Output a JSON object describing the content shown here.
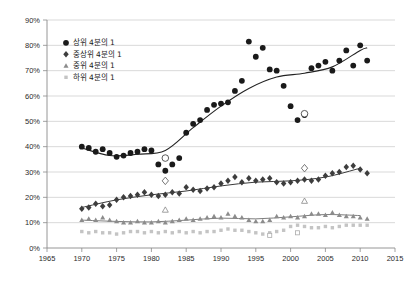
{
  "chart_data": {
    "type": "scatter",
    "title": "",
    "subtitle": "",
    "xlabel": "",
    "ylabel": "",
    "xlim": [
      1965,
      2015
    ],
    "ylim": [
      0,
      90
    ],
    "grid": true,
    "legend_position": "top-left",
    "x_ticks": [
      "1965",
      "1970",
      "1975",
      "1980",
      "1985",
      "1990",
      "1995",
      "2000",
      "2005",
      "2010",
      "2015"
    ],
    "y_ticks": [
      "0%",
      "10%",
      "20%",
      "30%",
      "40%",
      "50%",
      "60%",
      "70%",
      "80%",
      "90%"
    ],
    "series": [
      {
        "name": "상위 4분의 1",
        "marker": "circle-filled",
        "color": "#1a1a1a",
        "has_trendline": true,
        "points": [
          {
            "x": 1970,
            "y": 40.0
          },
          {
            "x": 1971,
            "y": 39.5
          },
          {
            "x": 1972,
            "y": 38.0
          },
          {
            "x": 1973,
            "y": 39.0
          },
          {
            "x": 1974,
            "y": 37.5
          },
          {
            "x": 1975,
            "y": 36.0
          },
          {
            "x": 1976,
            "y": 36.5
          },
          {
            "x": 1977,
            "y": 37.5
          },
          {
            "x": 1978,
            "y": 38.0
          },
          {
            "x": 1979,
            "y": 39.0
          },
          {
            "x": 1980,
            "y": 38.5
          },
          {
            "x": 1981,
            "y": 33.0
          },
          {
            "x": 1982,
            "y": 30.5
          },
          {
            "x": 1983,
            "y": 33.0
          },
          {
            "x": 1984,
            "y": 35.5
          },
          {
            "x": 1985,
            "y": 45.5
          },
          {
            "x": 1986,
            "y": 49.0
          },
          {
            "x": 1987,
            "y": 50.5
          },
          {
            "x": 1988,
            "y": 54.5
          },
          {
            "x": 1989,
            "y": 56.5
          },
          {
            "x": 1990,
            "y": 57.0
          },
          {
            "x": 1991,
            "y": 57.5
          },
          {
            "x": 1992,
            "y": 62.0
          },
          {
            "x": 1993,
            "y": 66.0
          },
          {
            "x": 1994,
            "y": 81.5
          },
          {
            "x": 1995,
            "y": 75.5
          },
          {
            "x": 1996,
            "y": 79.0
          },
          {
            "x": 1997,
            "y": 70.5
          },
          {
            "x": 1998,
            "y": 70.0
          },
          {
            "x": 1999,
            "y": 64.0
          },
          {
            "x": 2000,
            "y": 56.0
          },
          {
            "x": 2001,
            "y": 50.5
          },
          {
            "x": 2002,
            "y": 52.5
          },
          {
            "x": 2003,
            "y": 71.0
          },
          {
            "x": 2004,
            "y": 72.0
          },
          {
            "x": 2005,
            "y": 73.5
          },
          {
            "x": 2006,
            "y": 70.0
          },
          {
            "x": 2007,
            "y": 74.0
          },
          {
            "x": 2008,
            "y": 78.0
          },
          {
            "x": 2009,
            "y": 72.0
          },
          {
            "x": 2010,
            "y": 80.0
          },
          {
            "x": 2011,
            "y": 74.0
          }
        ],
        "open_points": [
          {
            "x": 1982,
            "y": 35.5
          },
          {
            "x": 2002,
            "y": 53.0
          }
        ],
        "trend": [
          {
            "x": 1970,
            "y": 39.5
          },
          {
            "x": 1974,
            "y": 36.5
          },
          {
            "x": 1978,
            "y": 37.0
          },
          {
            "x": 1982,
            "y": 38.5
          },
          {
            "x": 1986,
            "y": 47.5
          },
          {
            "x": 1990,
            "y": 56.0
          },
          {
            "x": 1994,
            "y": 63.0
          },
          {
            "x": 1998,
            "y": 67.5
          },
          {
            "x": 2002,
            "y": 69.0
          },
          {
            "x": 2006,
            "y": 71.5
          },
          {
            "x": 2010,
            "y": 78.0
          },
          {
            "x": 2011,
            "y": 79.0
          }
        ]
      },
      {
        "name": "중상위 4분의 1",
        "marker": "diamond-filled",
        "color": "#3d3d3d",
        "has_trendline": true,
        "points": [
          {
            "x": 1970,
            "y": 15.5
          },
          {
            "x": 1971,
            "y": 16.0
          },
          {
            "x": 1972,
            "y": 17.5
          },
          {
            "x": 1973,
            "y": 16.5
          },
          {
            "x": 1974,
            "y": 17.0
          },
          {
            "x": 1975,
            "y": 19.0
          },
          {
            "x": 1976,
            "y": 20.0
          },
          {
            "x": 1977,
            "y": 20.5
          },
          {
            "x": 1978,
            "y": 21.0
          },
          {
            "x": 1979,
            "y": 22.0
          },
          {
            "x": 1980,
            "y": 21.0
          },
          {
            "x": 1981,
            "y": 20.5
          },
          {
            "x": 1982,
            "y": 21.0
          },
          {
            "x": 1983,
            "y": 22.0
          },
          {
            "x": 1984,
            "y": 21.5
          },
          {
            "x": 1985,
            "y": 24.0
          },
          {
            "x": 1986,
            "y": 23.0
          },
          {
            "x": 1987,
            "y": 22.5
          },
          {
            "x": 1988,
            "y": 23.5
          },
          {
            "x": 1989,
            "y": 24.0
          },
          {
            "x": 1990,
            "y": 25.5
          },
          {
            "x": 1991,
            "y": 26.5
          },
          {
            "x": 1992,
            "y": 28.0
          },
          {
            "x": 1993,
            "y": 26.0
          },
          {
            "x": 1994,
            "y": 27.5
          },
          {
            "x": 1995,
            "y": 26.5
          },
          {
            "x": 1996,
            "y": 27.0
          },
          {
            "x": 1997,
            "y": 27.5
          },
          {
            "x": 1998,
            "y": 26.0
          },
          {
            "x": 1999,
            "y": 25.5
          },
          {
            "x": 2000,
            "y": 26.0
          },
          {
            "x": 2001,
            "y": 26.5
          },
          {
            "x": 2002,
            "y": 27.0
          },
          {
            "x": 2003,
            "y": 26.5
          },
          {
            "x": 2004,
            "y": 27.0
          },
          {
            "x": 2005,
            "y": 28.5
          },
          {
            "x": 2006,
            "y": 29.5
          },
          {
            "x": 2007,
            "y": 30.0
          },
          {
            "x": 2008,
            "y": 32.0
          },
          {
            "x": 2009,
            "y": 32.5
          },
          {
            "x": 2010,
            "y": 31.0
          },
          {
            "x": 2011,
            "y": 29.5
          }
        ],
        "open_points": [
          {
            "x": 1982,
            "y": 26.5
          },
          {
            "x": 2002,
            "y": 31.5
          }
        ],
        "trend": [
          {
            "x": 1970,
            "y": 16.0
          },
          {
            "x": 1975,
            "y": 19.0
          },
          {
            "x": 1980,
            "y": 21.0
          },
          {
            "x": 1985,
            "y": 22.5
          },
          {
            "x": 1990,
            "y": 24.5
          },
          {
            "x": 1995,
            "y": 26.0
          },
          {
            "x": 2000,
            "y": 26.5
          },
          {
            "x": 2005,
            "y": 28.0
          },
          {
            "x": 2010,
            "y": 31.5
          }
        ]
      },
      {
        "name": "중위 4분의 1",
        "marker": "triangle-filled",
        "color": "#8c8c8c",
        "has_trendline": true,
        "points": [
          {
            "x": 1970,
            "y": 11.0
          },
          {
            "x": 1971,
            "y": 11.5
          },
          {
            "x": 1972,
            "y": 11.0
          },
          {
            "x": 1973,
            "y": 12.0
          },
          {
            "x": 1974,
            "y": 11.0
          },
          {
            "x": 1975,
            "y": 10.5
          },
          {
            "x": 1976,
            "y": 10.0
          },
          {
            "x": 1977,
            "y": 10.0
          },
          {
            "x": 1978,
            "y": 10.5
          },
          {
            "x": 1979,
            "y": 10.0
          },
          {
            "x": 1980,
            "y": 10.0
          },
          {
            "x": 1981,
            "y": 10.5
          },
          {
            "x": 1982,
            "y": 10.0
          },
          {
            "x": 1983,
            "y": 10.5
          },
          {
            "x": 1984,
            "y": 11.0
          },
          {
            "x": 1985,
            "y": 11.5
          },
          {
            "x": 1986,
            "y": 11.0
          },
          {
            "x": 1987,
            "y": 11.5
          },
          {
            "x": 1988,
            "y": 12.0
          },
          {
            "x": 1989,
            "y": 12.5
          },
          {
            "x": 1990,
            "y": 12.0
          },
          {
            "x": 1991,
            "y": 13.5
          },
          {
            "x": 1992,
            "y": 12.5
          },
          {
            "x": 1993,
            "y": 12.0
          },
          {
            "x": 1994,
            "y": 11.0
          },
          {
            "x": 1995,
            "y": 10.5
          },
          {
            "x": 1996,
            "y": 10.5
          },
          {
            "x": 1997,
            "y": 11.0
          },
          {
            "x": 1998,
            "y": 12.5
          },
          {
            "x": 1999,
            "y": 12.0
          },
          {
            "x": 2000,
            "y": 12.5
          },
          {
            "x": 2001,
            "y": 12.0
          },
          {
            "x": 2002,
            "y": 12.5
          },
          {
            "x": 2003,
            "y": 13.5
          },
          {
            "x": 2004,
            "y": 13.5
          },
          {
            "x": 2005,
            "y": 13.0
          },
          {
            "x": 2006,
            "y": 14.0
          },
          {
            "x": 2007,
            "y": 13.0
          },
          {
            "x": 2008,
            "y": 12.5
          },
          {
            "x": 2009,
            "y": 12.5
          },
          {
            "x": 2010,
            "y": 12.0
          },
          {
            "x": 2011,
            "y": 11.5
          }
        ],
        "open_points": [
          {
            "x": 1982,
            "y": 15.0
          },
          {
            "x": 2002,
            "y": 18.5
          }
        ],
        "trend": [
          {
            "x": 1970,
            "y": 11.0
          },
          {
            "x": 1975,
            "y": 10.5
          },
          {
            "x": 1980,
            "y": 10.3
          },
          {
            "x": 1985,
            "y": 11.0
          },
          {
            "x": 1990,
            "y": 11.8
          },
          {
            "x": 1995,
            "y": 11.5
          },
          {
            "x": 2000,
            "y": 12.3
          },
          {
            "x": 2005,
            "y": 13.2
          },
          {
            "x": 2010,
            "y": 12.8
          }
        ]
      },
      {
        "name": "하위 4분의 1",
        "marker": "square-filled",
        "color": "#c4c4c4",
        "has_trendline": false,
        "points": [
          {
            "x": 1970,
            "y": 6.5
          },
          {
            "x": 1971,
            "y": 6.0
          },
          {
            "x": 1972,
            "y": 6.5
          },
          {
            "x": 1973,
            "y": 6.0
          },
          {
            "x": 1974,
            "y": 6.0
          },
          {
            "x": 1975,
            "y": 5.5
          },
          {
            "x": 1976,
            "y": 6.0
          },
          {
            "x": 1977,
            "y": 6.5
          },
          {
            "x": 1978,
            "y": 6.5
          },
          {
            "x": 1979,
            "y": 6.0
          },
          {
            "x": 1980,
            "y": 6.5
          },
          {
            "x": 1981,
            "y": 6.0
          },
          {
            "x": 1982,
            "y": 6.5
          },
          {
            "x": 1983,
            "y": 6.0
          },
          {
            "x": 1984,
            "y": 6.5
          },
          {
            "x": 1985,
            "y": 6.0
          },
          {
            "x": 1986,
            "y": 6.5
          },
          {
            "x": 1987,
            "y": 6.0
          },
          {
            "x": 1988,
            "y": 6.5
          },
          {
            "x": 1989,
            "y": 6.5
          },
          {
            "x": 1990,
            "y": 7.0
          },
          {
            "x": 1991,
            "y": 7.5
          },
          {
            "x": 1992,
            "y": 7.0
          },
          {
            "x": 1993,
            "y": 7.0
          },
          {
            "x": 1994,
            "y": 6.5
          },
          {
            "x": 1995,
            "y": 6.0
          },
          {
            "x": 1996,
            "y": 5.5
          },
          {
            "x": 1997,
            "y": 6.0
          },
          {
            "x": 1998,
            "y": 6.5
          },
          {
            "x": 1999,
            "y": 7.0
          },
          {
            "x": 2000,
            "y": 8.5
          },
          {
            "x": 2001,
            "y": 9.0
          },
          {
            "x": 2002,
            "y": 8.5
          },
          {
            "x": 2003,
            "y": 8.0
          },
          {
            "x": 2004,
            "y": 8.0
          },
          {
            "x": 2005,
            "y": 8.5
          },
          {
            "x": 2006,
            "y": 8.0
          },
          {
            "x": 2007,
            "y": 8.5
          },
          {
            "x": 2008,
            "y": 9.0
          },
          {
            "x": 2009,
            "y": 9.0
          },
          {
            "x": 2010,
            "y": 9.0
          },
          {
            "x": 2011,
            "y": 9.0
          }
        ],
        "open_points": [
          {
            "x": 1997,
            "y": 5.0
          },
          {
            "x": 2001,
            "y": 6.0
          }
        ],
        "trend": []
      }
    ]
  },
  "legend": {
    "items": [
      {
        "label": "상위 4분의 1",
        "marker": "circle-filled",
        "color": "#1a1a1a"
      },
      {
        "label": "중상위 4분의 1",
        "marker": "diamond-filled",
        "color": "#3d3d3d"
      },
      {
        "label": "중위 4분의 1",
        "marker": "triangle-filled",
        "color": "#8c8c8c"
      },
      {
        "label": "하위 4분의 1",
        "marker": "square-filled",
        "color": "#c4c4c4"
      }
    ]
  },
  "colors": {
    "background": "#ffffff",
    "gridline": "#c9c9c9",
    "axis": "#8a8a8a",
    "text": "#2b2b2b",
    "series_top": "#1a1a1a",
    "series_upper_mid": "#3d3d3d",
    "series_mid": "#8c8c8c",
    "series_bottom": "#c4c4c4"
  }
}
